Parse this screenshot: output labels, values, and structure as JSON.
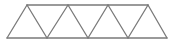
{
  "diagram": {
    "type": "warren-truss",
    "stroke_color": "#7a7a7a",
    "stroke_width": 1.3,
    "bottom_chord": [
      [
        7,
        38
      ],
      [
        47,
        38
      ],
      [
        88,
        38
      ],
      [
        128,
        38
      ],
      [
        167,
        38
      ]
    ],
    "top_chord": [
      [
        27,
        5
      ],
      [
        68,
        5
      ],
      [
        108,
        5
      ],
      [
        148,
        5
      ]
    ],
    "panels": 4,
    "triangles_pointing_up": 4,
    "triangles_pointing_down": 3
  }
}
